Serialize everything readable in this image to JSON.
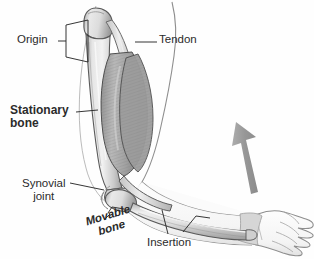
{
  "figure": {
    "type": "anatomical-diagram",
    "background_color": "#fefefe",
    "line_color": "#3a3a3a",
    "bone_fill": "#d9d9d9",
    "muscle_fill": "#a8a8a8",
    "arrow_color": "#9a9a9a",
    "skin_fill": "#fbfbfb"
  },
  "labels": {
    "origin": "Origin",
    "tendon": "Tendon",
    "stationary_bone_line1": "Stationary",
    "stationary_bone_line2": "bone",
    "synovial_joint_line1": "Synovial",
    "synovial_joint_line2": "joint",
    "movable_bone_line1": "Movable",
    "movable_bone_line2": "bone",
    "insertion": "Insertion"
  },
  "parts": {
    "humerus": "stationary-bone-humerus",
    "ulna": "movable-bone-ulna",
    "biceps": "biceps-muscle-belly",
    "upper_tendon": "proximal-tendon",
    "lower_tendon": "distal-tendon",
    "joint": "elbow-synovial-joint",
    "hand": "hand-outline",
    "motion_arrow": "upward-motion-arrow"
  }
}
